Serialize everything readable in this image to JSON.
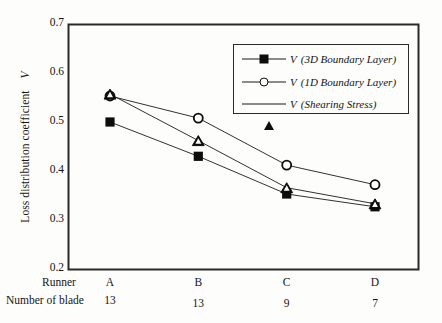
{
  "chart_data": {
    "type": "line",
    "title": "",
    "xlabel": "",
    "ylabel": "Loss distribution coefficient",
    "ylabel_symbol": "V",
    "categories": [
      "A",
      "B",
      "C",
      "D"
    ],
    "x_axis_rows": [
      {
        "title": "Runner",
        "values": [
          "A",
          "B",
          "C",
          "D"
        ]
      },
      {
        "title": "Number of blade",
        "values": [
          "13",
          "13",
          "9",
          "7"
        ]
      }
    ],
    "ylim": [
      0.2,
      0.7
    ],
    "yticks": [
      "0.7",
      "0.6",
      "0.5",
      "0.4",
      "0.3",
      "0.2"
    ],
    "ytick_values": [
      0.7,
      0.6,
      0.5,
      0.4,
      0.3,
      0.2
    ],
    "grid": false,
    "legend_position": "top-right",
    "series": [
      {
        "name": "V (3D Boundary Layer)",
        "symbol": "V",
        "qualifier": "(3D Boundary Layer)",
        "marker": "filled-square",
        "values": [
          0.5,
          0.43,
          0.353,
          0.327
        ]
      },
      {
        "name": "V (1D Boundary Layer)",
        "symbol": "V",
        "qualifier": "(1D Boundary Layer)",
        "marker": "open-circle",
        "values": [
          0.553,
          0.508,
          0.412,
          0.372
        ]
      },
      {
        "name": "V (Shearing Stress)",
        "symbol": "V",
        "qualifier": "(Shearing Stress)",
        "marker": "open-triangle",
        "values": [
          0.557,
          0.462,
          0.366,
          0.333
        ]
      }
    ]
  },
  "colors": {
    "background": "#fdfdfb",
    "axis": "#2a2a2a",
    "ink": "#0d0d0d",
    "series_line": "#1a1a1a"
  }
}
